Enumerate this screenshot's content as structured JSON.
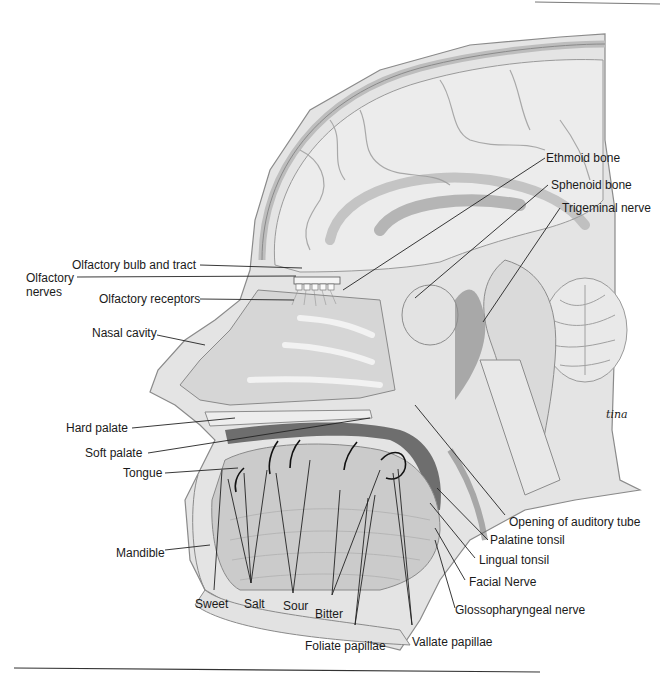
{
  "figure": {
    "type": "anatomical sagittal section of head",
    "colors": {
      "background": "#ffffff",
      "tissue_light": "#e6e6e6",
      "tissue_mid": "#cfcfcf",
      "tissue_dark": "#8c8c8c",
      "outline": "#7a7a7a",
      "leader_line": "#222222",
      "text": "#1a1a1a"
    },
    "signature": "tina"
  },
  "labels": {
    "ethmoid_bone": "Ethmoid bone",
    "sphenoid_bone": "Sphenoid bone",
    "trigeminal_nerve": "Trigeminal nerve",
    "olfactory_bulb_tract": "Olfactory bulb and tract",
    "olfactory_nerves": "Olfactory nerves",
    "olfactory_receptors": "Olfactory receptors",
    "nasal_cavity": "Nasal cavity",
    "hard_palate": "Hard palate",
    "soft_palate": "Soft palate",
    "tongue": "Tongue",
    "mandible": "Mandible",
    "sweet": "Sweet",
    "salt": "Salt",
    "sour": "Sour",
    "bitter": "Bitter",
    "foliate_papillae": "Foliate papillae",
    "vallate_papillae": "Vallate papillae",
    "opening_auditory_tube": "Opening of auditory tube",
    "palatine_tonsil": "Palatine tonsil",
    "lingual_tonsil": "Lingual tonsil",
    "facial_nerve": "Facial Nerve",
    "glossopharyngeal_nerve": "Glossopharyngeal nerve"
  }
}
